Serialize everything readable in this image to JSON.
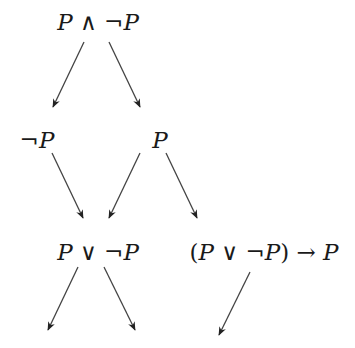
{
  "diagram": {
    "type": "tree",
    "colors": {
      "text": "#1a1a1a",
      "edge": "#444444",
      "background": "#ffffff"
    },
    "nodes": [
      {
        "id": "n1",
        "label": "P ∧ ¬P",
        "parts": [
          {
            "t": "P",
            "v": true
          },
          {
            "t": " ∧ ",
            "v": false
          },
          {
            "t": "¬",
            "v": false
          },
          {
            "t": "P",
            "v": true
          }
        ],
        "x": 98,
        "y": 30
      },
      {
        "id": "n2",
        "label": "¬P",
        "parts": [
          {
            "t": "¬",
            "v": false
          },
          {
            "t": "P",
            "v": true
          }
        ],
        "x": 37,
        "y": 148
      },
      {
        "id": "n3",
        "label": "P",
        "parts": [
          {
            "t": "P",
            "v": true
          }
        ],
        "x": 160,
        "y": 148
      },
      {
        "id": "n4",
        "label": "P ∨ ¬P",
        "parts": [
          {
            "t": "P",
            "v": true
          },
          {
            "t": " ∨ ",
            "v": false
          },
          {
            "t": "¬",
            "v": false
          },
          {
            "t": "P",
            "v": true
          }
        ],
        "x": 98,
        "y": 260
      },
      {
        "id": "n5",
        "label": "(P ∨ ¬P) → P",
        "parts": [
          {
            "t": "(",
            "v": false
          },
          {
            "t": "P",
            "v": true
          },
          {
            "t": " ∨ ",
            "v": false
          },
          {
            "t": "¬",
            "v": false
          },
          {
            "t": "P",
            "v": true
          },
          {
            "t": ") → ",
            "v": false
          },
          {
            "t": "P",
            "v": true
          }
        ],
        "x": 264,
        "y": 260
      }
    ],
    "edges": [
      {
        "from": "n1",
        "to": "n2",
        "x1": 84,
        "y1": 42,
        "x2": 53,
        "y2": 107
      },
      {
        "from": "n1",
        "to": "n3",
        "x1": 109,
        "y1": 42,
        "x2": 140,
        "y2": 107
      },
      {
        "from": "n2",
        "to": "n4",
        "x1": 52,
        "y1": 153,
        "x2": 83,
        "y2": 218
      },
      {
        "from": "n3",
        "to": "n4",
        "x1": 140,
        "y1": 153,
        "x2": 109,
        "y2": 218
      },
      {
        "from": "n3",
        "to": "n5",
        "x1": 166,
        "y1": 153,
        "x2": 197,
        "y2": 218
      },
      {
        "from": "n4",
        "to": "leaf-left",
        "x1": 78,
        "y1": 267,
        "x2": 48,
        "y2": 330
      },
      {
        "from": "n4",
        "to": "leaf-right",
        "x1": 104,
        "y1": 267,
        "x2": 135,
        "y2": 330
      },
      {
        "from": "n5",
        "to": "leaf-impl",
        "x1": 250,
        "y1": 272,
        "x2": 219,
        "y2": 335
      }
    ]
  }
}
